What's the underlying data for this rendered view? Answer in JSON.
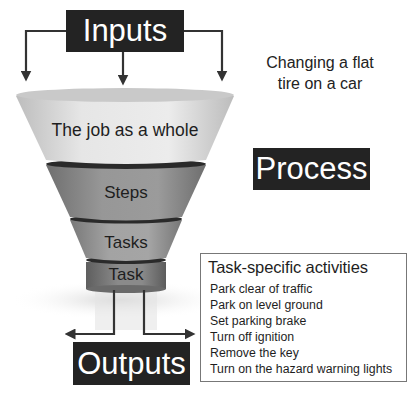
{
  "diagram": {
    "inputs_label": "Inputs",
    "outputs_label": "Outputs",
    "process_label": "Process",
    "caption_line1": "Changing a flat",
    "caption_line2": "tire on a car",
    "funnel": {
      "levels": [
        {
          "label": "The job as a whole",
          "color": "#e2e2e2"
        },
        {
          "label": "Steps",
          "color": "#8e8e8e"
        },
        {
          "label": "Tasks",
          "color": "#9a9a9a"
        },
        {
          "label": "Task",
          "color": "#7c7c7c"
        }
      ]
    },
    "activities": {
      "title": "Task-specific activities",
      "items": [
        "Park clear of traffic",
        "Park on level ground",
        "Set parking brake",
        "Turn off ignition",
        "Remove the key",
        "Turn on the hazard warning lights"
      ]
    },
    "colors": {
      "box_fill": "#232323",
      "box_text": "#ffffff",
      "arrow": "#333333",
      "band": "#2a2a2a"
    }
  }
}
